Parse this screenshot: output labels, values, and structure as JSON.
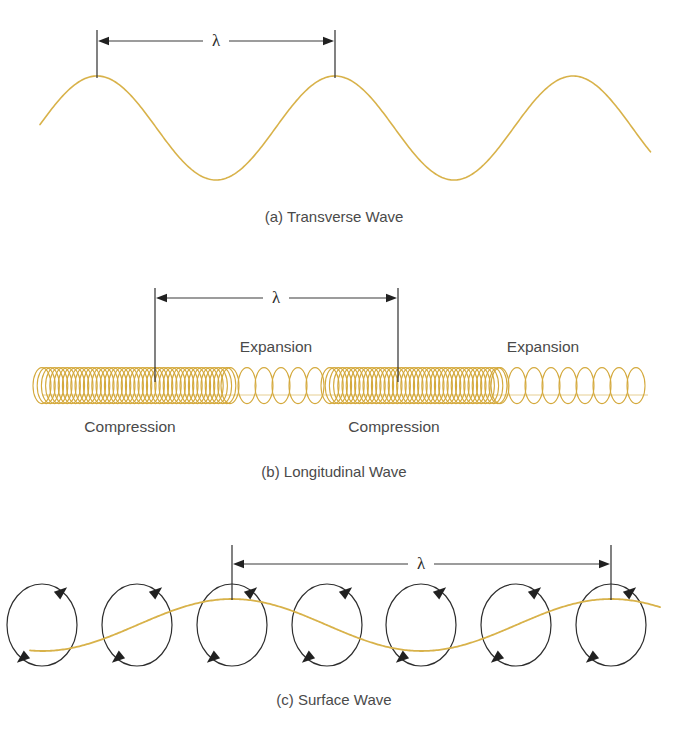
{
  "figure": {
    "background_color": "#ffffff",
    "wave_color": "#d8b24a",
    "spring_color": "#d4a93c",
    "ink_color": "#2e2e2e",
    "text_color": "#4a4a4a",
    "width": 681,
    "height": 744
  },
  "panels": [
    {
      "id": "transverse",
      "caption": "(a) Transverse Wave",
      "caption_x": 334,
      "caption_y": 222,
      "lambda_symbol": "λ",
      "wavelength_px": 238
    },
    {
      "id": "longitudinal",
      "caption": "(b) Longitudinal Wave",
      "caption_x": 334,
      "caption_y": 477,
      "lambda_symbol": "λ",
      "wavelength_px": 243,
      "labels": [
        {
          "text": "Expansion",
          "x": 276,
          "y": 352
        },
        {
          "text": "Expansion",
          "x": 543,
          "y": 352
        },
        {
          "text": "Compression",
          "x": 130,
          "y": 432
        },
        {
          "text": "Compression",
          "x": 394,
          "y": 432
        }
      ]
    },
    {
      "id": "surface",
      "caption": "(c) Surface Wave",
      "caption_x": 334,
      "caption_y": 705,
      "lambda_symbol": "λ",
      "wavelength_px": 379
    }
  ],
  "chart_data": {
    "type": "line",
    "xlabel": "",
    "ylabel": "",
    "grid": false,
    "legend": "none",
    "panels": [
      {
        "name": "(a) Transverse Wave",
        "type": "line",
        "description": "Sinusoidal transverse wave with three crests; wavelength marked between first and second crest.",
        "curve": {
          "form": "sine",
          "baseline_y": 128,
          "amplitude_px": 52,
          "wavelength_px": 238,
          "phase_crest_x": [
            97,
            335,
            573
          ],
          "trough_x": [
            216,
            454
          ],
          "x_start": 40,
          "x_end": 651,
          "stroke_width": 1.6
        },
        "dimension": {
          "label": "λ",
          "x_left": 97,
          "x_right": 335,
          "y": 41,
          "tick_top": 30,
          "tick_bottom": 78,
          "label_x": 216,
          "label_y": 46
        }
      },
      {
        "name": "(b) Longitudinal Wave",
        "type": "line",
        "description": "Helical spring drawn as ellipses with varying spacing: dense coils mark compressions, sparse coils mark expansions.",
        "spring": {
          "baseline_y": 395,
          "x_start": 42,
          "x_end": 648,
          "coil_ry": 18,
          "coil_rx": 9,
          "stroke_width": 1.1,
          "density_profile": [
            {
              "zone": "compression",
              "x_start": 42,
              "x_end": 230,
              "spacing_px": 4.2
            },
            {
              "zone": "expansion",
              "x_start": 230,
              "x_end": 330,
              "spacing_px": 17
            },
            {
              "zone": "compression",
              "x_start": 330,
              "x_end": 500,
              "spacing_px": 4.2
            },
            {
              "zone": "expansion",
              "x_start": 500,
              "x_end": 648,
              "spacing_px": 17
            }
          ]
        },
        "dimension": {
          "label": "λ",
          "x_left": 155,
          "x_right": 398,
          "y": 298,
          "tick_top": 288,
          "tick_bottom": 382,
          "label_x": 276,
          "label_y": 303
        }
      },
      {
        "name": "(c) Surface Wave",
        "type": "line",
        "description": "Sinusoidal surface wave overlaid with circular particle orbits; each orbit has two clockwise arrowheads.",
        "curve": {
          "form": "sine",
          "baseline_y": 625,
          "amplitude_px": 26,
          "wavelength_px": 379,
          "phase_crest_x": [
            232,
            611
          ],
          "trough_x": [
            421
          ],
          "x_start": 30,
          "x_end": 660,
          "stroke_width": 1.8
        },
        "orbits": {
          "center_y": 625,
          "rx": 35,
          "ry": 41,
          "stroke_width": 1.2,
          "rotation": "clockwise",
          "centers_x": [
            42,
            137,
            232,
            327,
            421,
            516,
            611
          ],
          "arrow_angles_deg": [
            55,
            235
          ]
        },
        "dimension": {
          "label": "λ",
          "x_left": 232,
          "x_right": 611,
          "y": 564,
          "tick_top": 545,
          "tick_bottom": 600,
          "label_x": 421,
          "label_y": 569
        }
      }
    ]
  }
}
